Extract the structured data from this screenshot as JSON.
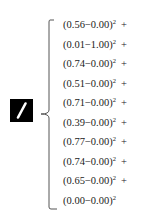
{
  "digit_image": {
    "label": "handwritten digit 1",
    "background": "#000000",
    "stroke": "#ffffff"
  },
  "terms": [
    {
      "a": "0.56",
      "b": "0.00",
      "exp": "2",
      "op": "+"
    },
    {
      "a": "0.01",
      "b": "1.00",
      "exp": "2",
      "op": "+"
    },
    {
      "a": "0.74",
      "b": "0.00",
      "exp": "2",
      "op": "+"
    },
    {
      "a": "0.51",
      "b": "0.00",
      "exp": "2",
      "op": "+"
    },
    {
      "a": "0.71",
      "b": "0.00",
      "exp": "2",
      "op": "+"
    },
    {
      "a": "0.39",
      "b": "0.00",
      "exp": "2",
      "op": "+"
    },
    {
      "a": "0.77",
      "b": "0.00",
      "exp": "2",
      "op": "+"
    },
    {
      "a": "0.74",
      "b": "0.00",
      "exp": "2",
      "op": "+"
    },
    {
      "a": "0.65",
      "b": "0.00",
      "exp": "2",
      "op": "+"
    },
    {
      "a": "0.00",
      "b": "0.00",
      "exp": "2",
      "op": ""
    }
  ]
}
